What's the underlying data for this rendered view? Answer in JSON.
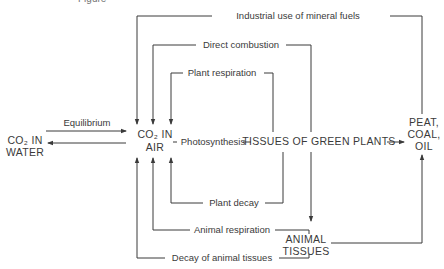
{
  "figure": {
    "top_partial_label": "Figure",
    "nodes": {
      "co2_water": {
        "line1": "CO₂ IN",
        "line2": "WATER"
      },
      "co2_air": {
        "line1": "CO₂ IN",
        "line2": "AIR"
      },
      "green_plants": {
        "label": "TISSUES OF GREEN PLANTS"
      },
      "fossil": {
        "line1": "PEAT,",
        "line2": "COAL,",
        "line3": "OIL"
      },
      "animal_tissues": {
        "line1": "ANIMAL",
        "line2": "TISSUES"
      }
    },
    "processes": {
      "industrial": "Industrial use of mineral fuels",
      "combustion": "Direct combustion",
      "plant_respiration": "Plant respiration",
      "equilibrium": "Equilibrium",
      "photosynthesis": "Photosynthesis",
      "plant_decay": "Plant decay",
      "animal_respiration": "Animal respiration",
      "animal_decay": "Decay of animal tissues"
    },
    "colors": {
      "ink": "#3a3a3a",
      "background": "#ffffff"
    }
  }
}
